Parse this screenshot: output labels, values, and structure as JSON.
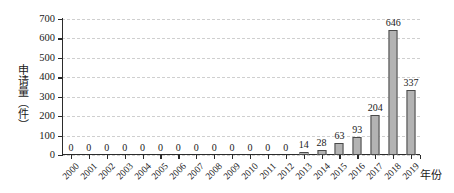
{
  "chart_data": {
    "type": "bar",
    "title": "",
    "subtitle": "",
    "xlabel": "年份",
    "ylabel": "申请量（件）",
    "categories": [
      "2000",
      "2001",
      "2002",
      "2003",
      "2004",
      "2005",
      "2006",
      "2007",
      "2008",
      "2009",
      "2010",
      "2011",
      "2012",
      "2013",
      "2014",
      "2015",
      "2016",
      "2017",
      "2018",
      "2019"
    ],
    "values": [
      0,
      0,
      0,
      0,
      0,
      0,
      0,
      0,
      0,
      0,
      0,
      0,
      0,
      14,
      28,
      63,
      93,
      204,
      646,
      337
    ],
    "value_labels": [
      "0",
      "0",
      "0",
      "0",
      "0",
      "0",
      "0",
      "0",
      "0",
      "0",
      "0",
      "0",
      "0",
      "14",
      "28",
      "63",
      "93",
      "204",
      "646",
      "337"
    ],
    "ylim": [
      0,
      700
    ],
    "yticks": [
      0,
      100,
      200,
      300,
      400,
      500,
      600,
      700
    ],
    "ytick_labels": [
      "0",
      "100",
      "200",
      "300",
      "400",
      "500",
      "600",
      "700"
    ],
    "grid": true,
    "grid_style": "dashed",
    "grid_axis": "y",
    "legend": false,
    "bar_color": "#b3b3b3",
    "bar_edge_color": "#4a4a4a",
    "axis_color": "#2b2b2b",
    "grid_color": "#cfcfcf",
    "xtick_rotation": -45,
    "series": [
      {
        "name": "申请量",
        "values": [
          0,
          0,
          0,
          0,
          0,
          0,
          0,
          0,
          0,
          0,
          0,
          0,
          0,
          14,
          28,
          63,
          93,
          204,
          646,
          337
        ]
      }
    ]
  }
}
